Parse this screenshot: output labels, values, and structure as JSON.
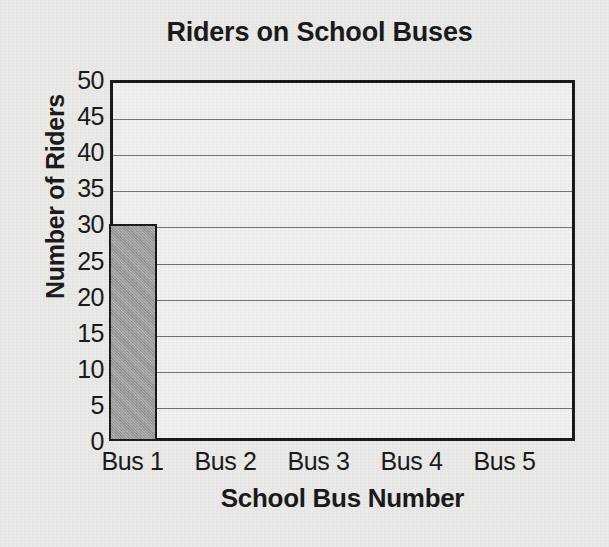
{
  "chart_data": {
    "type": "bar",
    "title": "Riders on School Buses",
    "xlabel": "School Bus Number",
    "ylabel": "Number of Riders",
    "categories": [
      "Bus 1",
      "Bus 2",
      "Bus 3",
      "Bus 4",
      "Bus 5"
    ],
    "values": [
      30,
      0,
      0,
      0,
      0
    ],
    "ylim": [
      0,
      50
    ],
    "ytick_step": 5,
    "yticks": [
      0,
      5,
      10,
      15,
      20,
      25,
      30,
      35,
      40,
      45,
      50
    ],
    "ytick_labels": [
      "0",
      "5",
      "10",
      "15",
      "20",
      "25",
      "30",
      "35",
      "40",
      "45",
      "50"
    ],
    "grid": true,
    "grid_axis": "y",
    "legend": null,
    "bar_color": "#9b9b9b",
    "bar_edge_color": "#141414",
    "plot_background": "#efefed",
    "figure_background": "#e9e9e7",
    "text_color": "#141414",
    "gridline_color": "#6e6e6e"
  }
}
